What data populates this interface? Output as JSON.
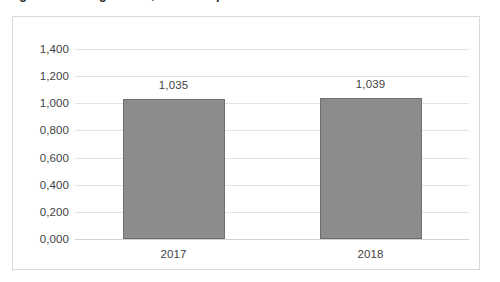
{
  "caption": {
    "text": "Figure 1. Average score, 2017 compared to 2018"
  },
  "chart_data": {
    "type": "bar",
    "title": "",
    "xlabel": "",
    "ylabel": "",
    "categories": [
      "2017",
      "2018"
    ],
    "values": [
      1.035,
      1.039
    ],
    "value_labels": [
      "1,035",
      "1,039"
    ],
    "ylim": [
      0.0,
      1.4
    ],
    "ytick_values": [
      0.0,
      0.2,
      0.4,
      0.6,
      0.8,
      1.0,
      1.2,
      1.4
    ],
    "ytick_labels": [
      "0,000",
      "0,200",
      "0,400",
      "0,600",
      "0,800",
      "1,000",
      "1,200",
      "1,400"
    ],
    "grid": true,
    "legend": "none",
    "decimal_separator": ",",
    "series": [
      {
        "name": "Series 1",
        "values": [
          1.035,
          1.039
        ],
        "color": "#8c8c8c",
        "border_color": "#6f6f6f"
      }
    ],
    "colors": {
      "bar_fill": "#8c8c8c",
      "bar_border": "#6f6f6f",
      "gridline": "#e4e4e4",
      "axis_line": "#d2d2d2",
      "frame_border": "#d9d9d9",
      "text": "#3f3f3f",
      "background": "#ffffff"
    }
  }
}
